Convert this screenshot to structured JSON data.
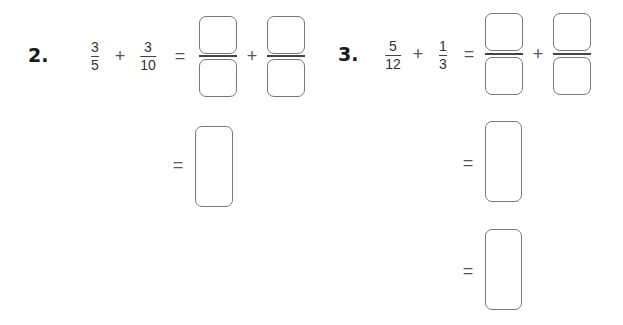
{
  "problems": [
    {
      "number": "2.",
      "fraction_a": {
        "numerator": "3",
        "denominator": "5"
      },
      "operator": "+",
      "fraction_b": {
        "numerator": "3",
        "denominator": "10"
      },
      "equals": "=",
      "answer_plus": "+",
      "steps": [
        "="
      ]
    },
    {
      "number": "3.",
      "fraction_a": {
        "numerator": "5",
        "denominator": "12"
      },
      "operator": "+",
      "fraction_b": {
        "numerator": "1",
        "denominator": "3"
      },
      "equals": "=",
      "answer_plus": "+",
      "steps": [
        "=",
        "="
      ]
    }
  ]
}
